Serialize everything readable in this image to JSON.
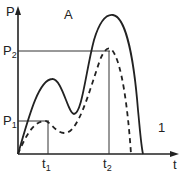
{
  "diagram": {
    "panel_label": "A",
    "curve_label": "1",
    "y_axis": {
      "label": "P"
    },
    "x_axis": {
      "label": "t"
    },
    "marks": {
      "p1": {
        "base": "P",
        "sub": "1"
      },
      "p2": {
        "base": "P",
        "sub": "2"
      },
      "t1": {
        "base": "t",
        "sub": "1"
      },
      "t2": {
        "base": "t",
        "sub": "2"
      }
    },
    "series": [
      {
        "name": "solid-curve",
        "style": "solid"
      },
      {
        "name": "dashed-curve",
        "style": "dashed"
      }
    ]
  }
}
